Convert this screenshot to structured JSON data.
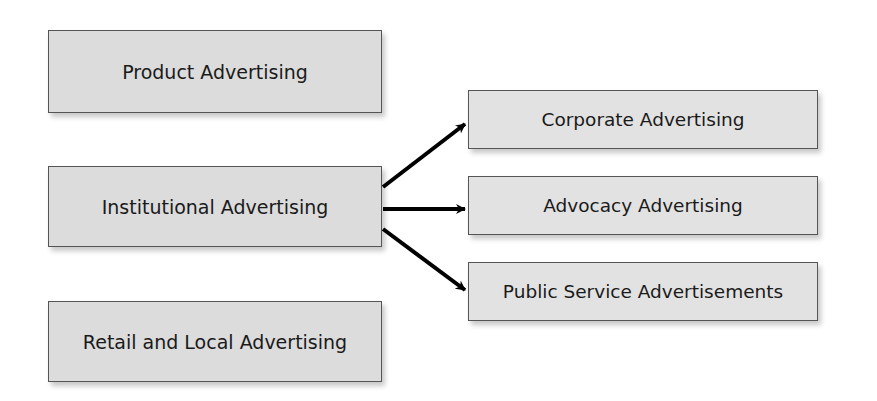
{
  "diagram": {
    "left_boxes": [
      {
        "label": "Product Advertising"
      },
      {
        "label": "Institutional Advertising"
      },
      {
        "label": "Retail and Local Advertising"
      }
    ],
    "right_boxes": [
      {
        "label": "Corporate Advertising"
      },
      {
        "label": "Advocacy Advertising"
      },
      {
        "label": "Public Service Advertisements"
      }
    ],
    "edges": [
      {
        "from": "Institutional Advertising",
        "to": "Corporate Advertising"
      },
      {
        "from": "Institutional Advertising",
        "to": "Advocacy Advertising"
      },
      {
        "from": "Institutional Advertising",
        "to": "Public Service Advertisements"
      }
    ],
    "colors": {
      "box_fill": "#dcdcdc",
      "box_border": "#555555",
      "arrow": "#000000"
    }
  }
}
